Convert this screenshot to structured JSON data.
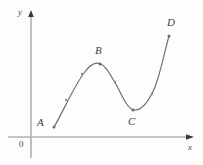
{
  "figure": {
    "background_color": "#fdfdfd",
    "axis_color": "#b0b0b0",
    "curve_color": "#6b6b6b",
    "label_color": "#3d3d3d",
    "axes": {
      "y_axis_label": "y",
      "x_axis_label": "x",
      "origin_label": "0",
      "y_axis_label_pos": {
        "x": 18,
        "y": 8
      },
      "x_axis_label_pos": {
        "x": 188,
        "y": 143
      },
      "origin_label_pos": {
        "x": 19,
        "y": 140
      },
      "origin_px": {
        "x": 31,
        "y": 137
      },
      "y_axis_top_px": 12,
      "x_axis_right_px": 193
    },
    "labeled_points": [
      {
        "name": "A",
        "label": "A",
        "dot": {
          "x": 54,
          "y": 127
        },
        "label_pos": {
          "x": 37,
          "y": 117
        }
      },
      {
        "name": "B",
        "label": "B",
        "dot": {
          "x": 100,
          "y": 64
        },
        "label_pos": {
          "x": 95,
          "y": 45
        }
      },
      {
        "name": "C",
        "label": "C",
        "dot": {
          "x": 133,
          "y": 110
        },
        "label_pos": {
          "x": 128,
          "y": 116
        }
      },
      {
        "name": "D",
        "label": "D",
        "dot": {
          "x": 169,
          "y": 36
        },
        "label_pos": {
          "x": 167,
          "y": 17
        }
      }
    ],
    "marker_points": [
      {
        "x": 66,
        "y": 100
      },
      {
        "x": 82,
        "y": 74
      },
      {
        "x": 115,
        "y": 82
      },
      {
        "x": 152,
        "y": 94
      }
    ],
    "curve_path": "M 54 127 C 63 112 73 88 84 73 C 91 63 97 62 101 64 C 107 67 111 76 117 86 C 123 98 128 110 135 110 C 143 110 149 101 155 87 C 161 71 165 50 169 36"
  },
  "chart_data": {
    "type": "line",
    "title": "",
    "xlabel": "x",
    "ylabel": "y",
    "grid": false,
    "legend": "none",
    "annotations": [
      "A",
      "B",
      "C",
      "D",
      "0"
    ],
    "labeled_feature_points": [
      {
        "label": "A",
        "feature": "start / low point",
        "x_px": 54,
        "y_px": 127
      },
      {
        "label": "B",
        "feature": "local maximum",
        "x_px": 100,
        "y_px": 64
      },
      {
        "label": "C",
        "feature": "local minimum",
        "x_px": 133,
        "y_px": 110
      },
      {
        "label": "D",
        "feature": "end / high point",
        "x_px": 169,
        "y_px": 36
      }
    ],
    "x": [
      54,
      66,
      82,
      100,
      115,
      133,
      152,
      169
    ],
    "y_pixel": [
      127,
      100,
      74,
      64,
      82,
      110,
      94,
      36
    ],
    "axis_ranges": {
      "x_px": [
        31,
        193
      ],
      "y_px": [
        12,
        137
      ]
    }
  }
}
